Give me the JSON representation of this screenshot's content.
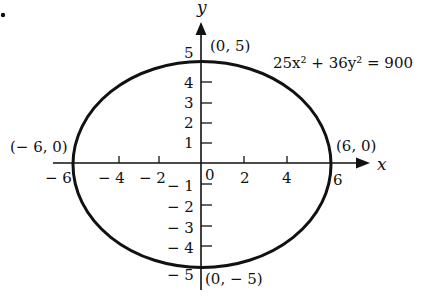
{
  "figure": {
    "type": "ellipse-graph",
    "equation": "25x² + 36y² = 900",
    "x_axis_label": "x",
    "y_axis_label": "y",
    "center": [
      0,
      0
    ],
    "semi_major_x": 6,
    "semi_minor_y": 5,
    "points": [
      {
        "label": "(0, 5)",
        "x": 0,
        "y": 5
      },
      {
        "label": "(0, − 5)",
        "x": 0,
        "y": -5
      },
      {
        "label": "(− 6, 0)",
        "x": -6,
        "y": 0
      },
      {
        "label": "(6, 0)",
        "x": 6,
        "y": 0
      }
    ],
    "x_ticks": [
      {
        "value": -6,
        "label": "− 6"
      },
      {
        "value": -4,
        "label": "− 4"
      },
      {
        "value": -2,
        "label": "− 2"
      },
      {
        "value": 0,
        "label": "0"
      },
      {
        "value": 2,
        "label": "2"
      },
      {
        "value": 4,
        "label": "4"
      },
      {
        "value": 6,
        "label": "6"
      }
    ],
    "y_ticks": [
      {
        "value": 5,
        "label": "5"
      },
      {
        "value": 4,
        "label": "4"
      },
      {
        "value": 3,
        "label": "3"
      },
      {
        "value": 2,
        "label": "2"
      },
      {
        "value": 1,
        "label": "1"
      },
      {
        "value": -1,
        "label": "− 1"
      },
      {
        "value": -2,
        "label": "− 2"
      },
      {
        "value": -3,
        "label": "− 3"
      },
      {
        "value": -4,
        "label": "− 4"
      },
      {
        "value": -5,
        "label": "− 5"
      }
    ],
    "colors": {
      "ink": "#111111",
      "background": "#ffffff"
    }
  }
}
